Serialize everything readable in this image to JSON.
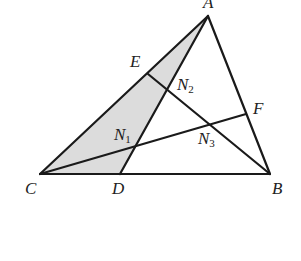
{
  "diagram": {
    "type": "triangle-cevians",
    "colors": {
      "line": "#1a1a1a",
      "shade": "#dcdcdc",
      "background": "#ffffff"
    },
    "points": {
      "A": {
        "label": "A",
        "x": 208,
        "y": 16
      },
      "B": {
        "label": "B",
        "x": 270,
        "y": 174
      },
      "C": {
        "label": "C",
        "x": 40,
        "y": 174
      },
      "D": {
        "label": "D",
        "x": 120,
        "y": 174
      },
      "E": {
        "label": "E",
        "x": 148,
        "y": 74
      },
      "F": {
        "label": "F",
        "x": 246,
        "y": 114
      },
      "N1": {
        "label": "N",
        "sub": "1",
        "x": 136,
        "y": 146
      },
      "N2": {
        "label": "N",
        "sub": "2",
        "x": 168,
        "y": 88
      },
      "N3": {
        "label": "N",
        "sub": "3",
        "x": 210,
        "y": 125
      }
    },
    "segments": [
      [
        "C",
        "A"
      ],
      [
        "A",
        "B"
      ],
      [
        "C",
        "B"
      ],
      [
        "A",
        "D"
      ],
      [
        "E",
        "B"
      ],
      [
        "C",
        "F"
      ]
    ],
    "shaded_region": [
      "A",
      "C",
      "D"
    ]
  }
}
